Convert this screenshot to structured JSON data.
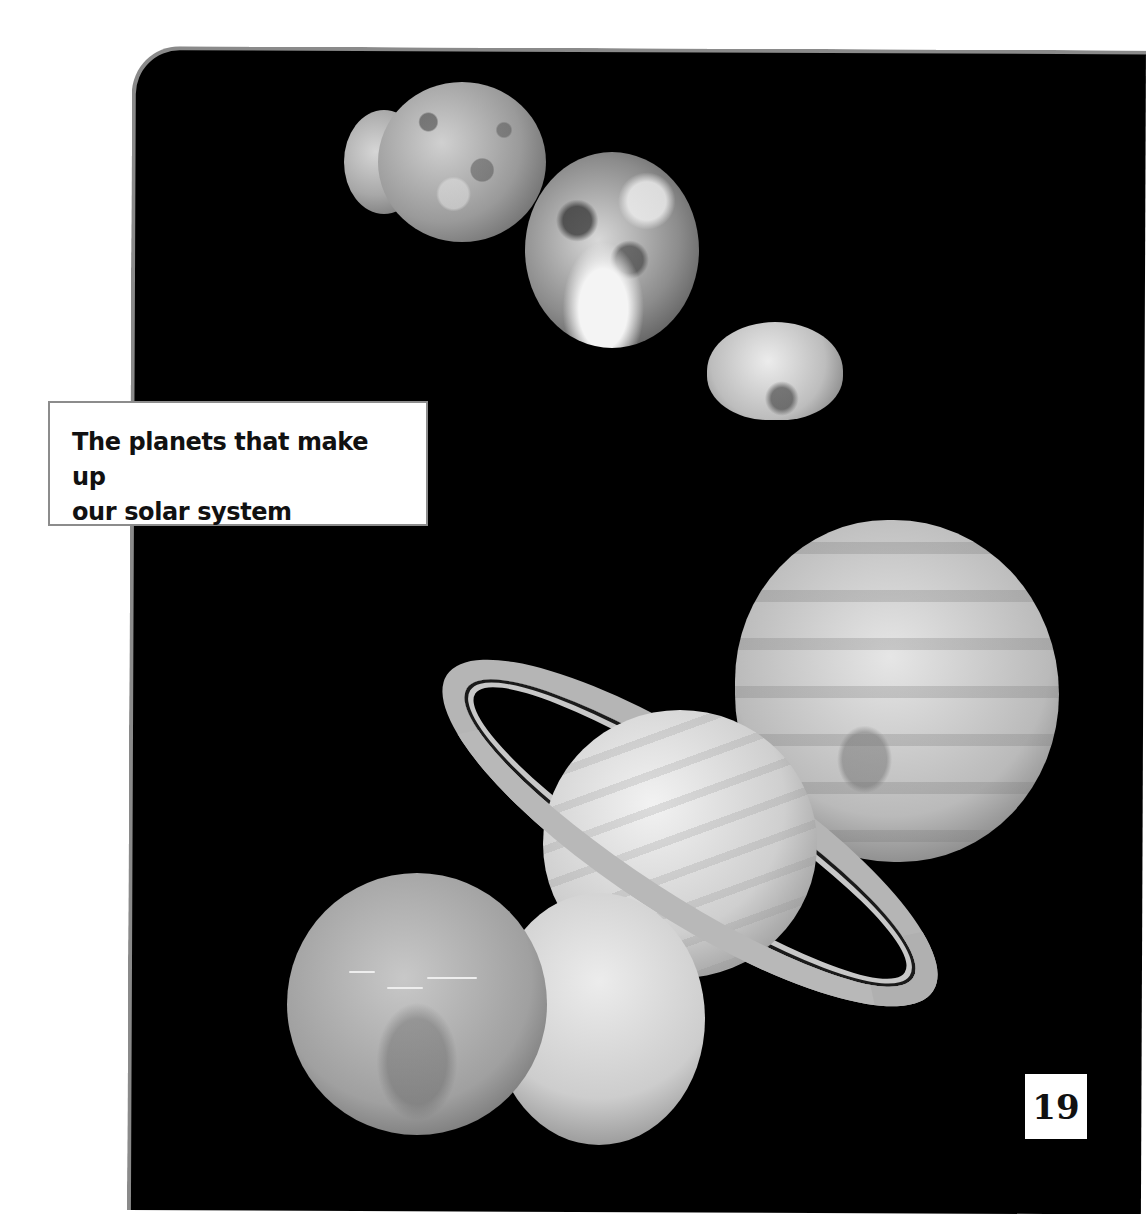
{
  "caption": {
    "line1": "The planets that make up",
    "line2": "our solar system"
  },
  "page": {
    "number": "19"
  },
  "illustration": {
    "description": "Montage of solar system planets on black background",
    "planets": [
      "Mercury",
      "Venus",
      "Earth",
      "Mars",
      "Jupiter",
      "Saturn",
      "Uranus",
      "Neptune"
    ]
  },
  "colors": {
    "panel_background": "#000000",
    "panel_border": "#8a8a8a",
    "page_background": "#ffffff",
    "caption_border": "#8c8c8c",
    "text": "#111111"
  }
}
